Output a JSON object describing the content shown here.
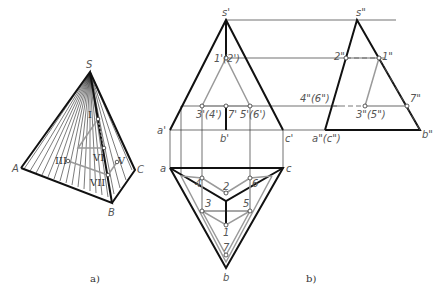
{
  "figure_a": {
    "caption": "a)",
    "vertices": {
      "S": "S",
      "A": "A",
      "B": "B",
      "C": "C"
    },
    "section_labels": {
      "I": "I",
      "III": "III",
      "V": "V",
      "VI": "VI",
      "VII": "VII"
    }
  },
  "figure_b": {
    "caption": "b)",
    "front_view": {
      "apex": "s'",
      "base_left": "a'",
      "base_mid": "b'",
      "base_right": "c'",
      "p12": "1'(2')",
      "p34": "3'(4')",
      "p7": "7'",
      "p56": "5'(6')"
    },
    "side_view": {
      "apex": "s\"",
      "p2": "2\"",
      "p1": "1\"",
      "p46": "4\"(6\")",
      "p35": "3\"(5\")",
      "p7": "7\"",
      "base_ac": "a\"(c\")",
      "base_b": "b\""
    },
    "top_view": {
      "a": "a",
      "c": "c",
      "b": "b",
      "p2": "2",
      "p4": "4",
      "p6": "6",
      "p3": "3",
      "p5": "5",
      "p1": "1",
      "p7": "7"
    }
  },
  "colors": {
    "ink": "#1a1a1a",
    "section": "#9a9a9a",
    "thin": "#333333"
  }
}
